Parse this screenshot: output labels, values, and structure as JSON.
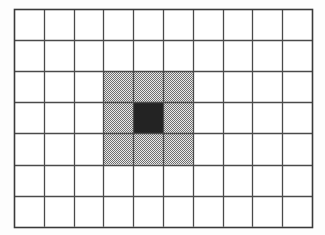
{
  "figure": {
    "title": "Square grid with shaded 3x3 neighborhood",
    "type": "grid-diagram",
    "background_color": "#fdfdfd"
  },
  "grid": {
    "columns": 10,
    "rows": 7,
    "origin_x": 14,
    "origin_y": 9,
    "cell_width": 29.8,
    "cell_height": 31.1,
    "line_color": "#4a4a4a",
    "line_width": 1.3,
    "border_color": "#3a3a3a",
    "border_width": 1.6,
    "cell_fill": "#ffffff"
  },
  "regions": [
    {
      "name": "shaded-neighborhood",
      "style": "hatched-checker",
      "fill_color": "#9a9a9a",
      "pattern": "checkerboard-dither",
      "col_start": 4,
      "col_end": 6,
      "row_start": 3,
      "row_end": 5,
      "width_cells": 3,
      "height_cells": 3
    },
    {
      "name": "center-cell",
      "style": "solid",
      "fill_color": "#232323",
      "col_start": 5,
      "col_end": 5,
      "row_start": 4,
      "row_end": 4,
      "width_cells": 1,
      "height_cells": 1
    }
  ],
  "chart_data": {
    "type": "heatmap",
    "title": "Square grid with shaded 3x3 neighborhood",
    "xlabel": "",
    "ylabel": "",
    "columns": 10,
    "rows": 7,
    "legend": [
      {
        "label": "empty cell",
        "color": "#ffffff"
      },
      {
        "label": "shaded neighborhood",
        "color": "#9a9a9a"
      },
      {
        "label": "center cell",
        "color": "#232323"
      }
    ],
    "values": [
      [
        0,
        0,
        0,
        0,
        0,
        0,
        0,
        0,
        0,
        0
      ],
      [
        0,
        0,
        0,
        0,
        0,
        0,
        0,
        0,
        0,
        0
      ],
      [
        0,
        0,
        0,
        1,
        1,
        1,
        0,
        0,
        0,
        0
      ],
      [
        0,
        0,
        0,
        1,
        2,
        1,
        0,
        0,
        0,
        0
      ],
      [
        0,
        0,
        0,
        1,
        1,
        1,
        0,
        0,
        0,
        0
      ],
      [
        0,
        0,
        0,
        0,
        0,
        0,
        0,
        0,
        0,
        0
      ],
      [
        0,
        0,
        0,
        0,
        0,
        0,
        0,
        0,
        0,
        0
      ]
    ],
    "value_meanings": {
      "0": "empty",
      "1": "shaded",
      "2": "center"
    },
    "grid": true,
    "legend_position": "none"
  }
}
